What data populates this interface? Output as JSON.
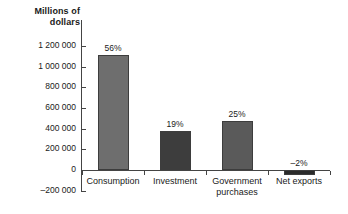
{
  "chart_data": {
    "type": "bar",
    "title": "",
    "ylabel": "Millions of dollars",
    "xlabel": "",
    "ylim": [
      -200000,
      1200000
    ],
    "ytick_step": 200000,
    "grid": false,
    "legend": "none",
    "ytick_labels": [
      "1 200 000",
      "1 000 000",
      "800 000",
      "600 000",
      "400 000",
      "200 000",
      "0",
      "–200 000"
    ],
    "ytick_values": [
      1200000,
      1000000,
      800000,
      600000,
      400000,
      200000,
      0,
      -200000
    ],
    "categories": [
      "Consumption",
      "Investment",
      "Government purchases",
      "Net exports"
    ],
    "values": [
      1115000,
      380000,
      470000,
      -45000
    ],
    "data_labels": [
      "56%",
      "19%",
      "25%",
      "–2%"
    ],
    "bar_colors": [
      "#6e6e6e",
      "#3d3d3d",
      "#5a5a5a",
      "#2b2b2b"
    ],
    "axis_color": "#444444",
    "background": "#ffffff"
  },
  "category_label_lines": [
    [
      "Consumption"
    ],
    [
      "Investment"
    ],
    [
      "Government",
      "purchases"
    ],
    [
      "Net exports"
    ]
  ],
  "axis_title_lines": [
    "Millions of",
    "dollars"
  ]
}
